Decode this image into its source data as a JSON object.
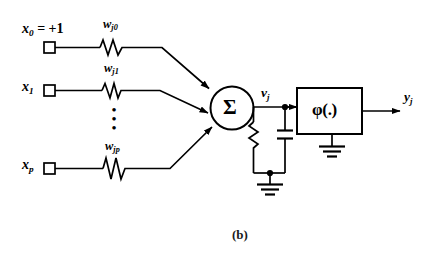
{
  "figure": {
    "caption": "(b)",
    "colors": {
      "stroke": "#000000",
      "background": "#ffffff",
      "text": "#000000"
    }
  },
  "inputs": [
    {
      "id": "x0",
      "label_base": "x",
      "label_sub": "0",
      "label_suffix": " = +1",
      "terminal": "square-terminal",
      "weight_base": "w",
      "weight_sub": "j0",
      "weight_component": "resistor"
    },
    {
      "id": "x1",
      "label_base": "x",
      "label_sub": "1",
      "label_suffix": "",
      "terminal": "square-terminal",
      "weight_base": "w",
      "weight_sub": "j1",
      "weight_component": "resistor"
    },
    {
      "id": "xp",
      "label_base": "x",
      "label_sub": "p",
      "label_suffix": "",
      "terminal": "square-terminal",
      "weight_base": "w",
      "weight_sub": "jp",
      "weight_component": "resistor"
    }
  ],
  "ellipsis": {
    "symbol": "•",
    "count": 3,
    "orientation": "vertical"
  },
  "summing_junction": {
    "symbol": "Σ",
    "shape": "circle",
    "name": "summing-junction"
  },
  "induced_field": {
    "label_base": "v",
    "label_sub": "j"
  },
  "rc_network": {
    "resistor": "resistor",
    "capacitor": "capacitor",
    "ground": "ground"
  },
  "activation": {
    "label": "φ(.)",
    "shape": "rectangle",
    "ground": "ground"
  },
  "output": {
    "label_base": "y",
    "label_sub": "j"
  }
}
